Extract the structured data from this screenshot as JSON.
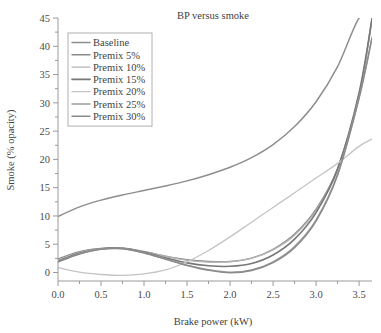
{
  "chart_data": {
    "type": "line",
    "title": "BP versus smoke",
    "xlabel": "Brake power (kW)",
    "ylabel": "Smoke (% opacity)",
    "xlim": [
      0.0,
      3.65
    ],
    "ylim": [
      -1.5,
      45
    ],
    "grid": false,
    "legend_position": "upper-left",
    "xticks": [
      "0.0",
      "0.5",
      "1.0",
      "1.5",
      "2.0",
      "2.5",
      "3.0",
      "3.5"
    ],
    "xtick_values": [
      0.0,
      0.5,
      1.0,
      1.5,
      2.0,
      2.5,
      3.0,
      3.5
    ],
    "yticks": [
      "0",
      "5",
      "10",
      "15",
      "20",
      "25",
      "30",
      "35",
      "40",
      "45"
    ],
    "ytick_values": [
      0,
      5,
      10,
      15,
      20,
      25,
      30,
      35,
      40,
      45
    ],
    "x": [
      0.0,
      0.25,
      0.5,
      0.75,
      1.0,
      1.25,
      1.5,
      1.75,
      2.0,
      2.25,
      2.5,
      2.75,
      3.0,
      3.25,
      3.5,
      3.65
    ],
    "series": [
      {
        "name": "Baseline",
        "color": "#8e8e8e",
        "width": 1.5,
        "values": [
          9.9,
          11.6,
          12.8,
          13.7,
          14.5,
          15.3,
          16.2,
          17.3,
          18.6,
          20.3,
          22.6,
          25.8,
          30.2,
          36.4,
          45.0,
          45.0
        ]
      },
      {
        "name": "Premix 5%",
        "color": "#8a8a8a",
        "width": 1.4,
        "values": [
          2.4,
          3.7,
          4.25,
          4.3,
          3.7,
          2.9,
          2.25,
          1.95,
          1.95,
          2.55,
          4.1,
          6.8,
          11.2,
          18.4,
          31.5,
          44.8
        ]
      },
      {
        "name": "Premix 10%",
        "color": "#b4b4b4",
        "width": 1.3,
        "values": [
          2.2,
          3.55,
          4.2,
          4.3,
          3.75,
          2.85,
          2.15,
          1.85,
          1.9,
          2.5,
          4.0,
          6.6,
          11.0,
          18.1,
          31.2,
          44.6
        ]
      },
      {
        "name": "Premix 15%",
        "color": "#777777",
        "width": 1.6,
        "values": [
          2.0,
          3.4,
          4.2,
          4.3,
          3.6,
          2.6,
          1.7,
          1.2,
          1.1,
          1.6,
          3.1,
          5.9,
          10.6,
          18.3,
          31.8,
          44.9
        ]
      },
      {
        "name": "Premix 20%",
        "color": "#c4c4c4",
        "width": 1.3,
        "values": [
          0.85,
          0.05,
          -0.35,
          -0.5,
          -0.25,
          0.45,
          1.9,
          3.9,
          6.3,
          8.9,
          11.5,
          14.1,
          16.7,
          19.3,
          22.3,
          23.6
        ]
      },
      {
        "name": "Premix 25%",
        "color": "#9c9c9c",
        "width": 1.4,
        "values": [
          1.9,
          3.3,
          4.15,
          4.25,
          3.5,
          2.4,
          1.3,
          0.5,
          0.05,
          0.45,
          1.9,
          4.6,
          9.3,
          17.4,
          31.0,
          41.6
        ]
      },
      {
        "name": "Premix 30%",
        "color": "#8a8a8a",
        "width": 1.4,
        "values": [
          1.85,
          3.25,
          4.1,
          4.2,
          3.45,
          2.35,
          1.25,
          0.4,
          -0.05,
          0.35,
          1.75,
          4.4,
          9.1,
          17.2,
          30.8,
          41.4
        ]
      }
    ]
  },
  "legend": {
    "items": [
      {
        "label": "Baseline"
      },
      {
        "label": "Premix 5%"
      },
      {
        "label": "Premix 10%"
      },
      {
        "label": "Premix 15%"
      },
      {
        "label": "Premix 20%"
      },
      {
        "label": "Premix 25%"
      },
      {
        "label": "Premix 30%"
      }
    ]
  }
}
